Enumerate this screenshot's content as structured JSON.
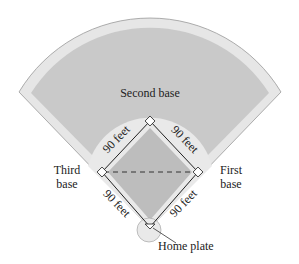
{
  "diagram": {
    "labels": {
      "second_base": "Second base",
      "third_base_line1": "Third",
      "third_base_line2": "base",
      "first_base_line1": "First",
      "first_base_line2": "base",
      "home_plate": "Home plate"
    },
    "side_lengths": {
      "home_to_first": "90 feet",
      "first_to_second": "90 feet",
      "second_to_third": "90 feet",
      "third_to_home": "90 feet"
    },
    "colors": {
      "outfield": "#c8c8c8",
      "warning_track": "#e6e6e6",
      "infield_dirt": "#e9e9e9",
      "infield_grass": "#bdbdbd",
      "lines": "#333333"
    }
  }
}
